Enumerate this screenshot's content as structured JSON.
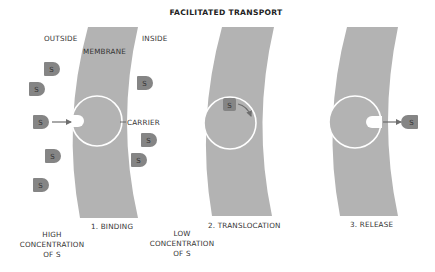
{
  "title": "FACILITATED TRANSPORT",
  "labels": {
    "outside": "OUTSIDE",
    "inside": "INSIDE",
    "membrane": "MEMBRANE",
    "carrier": "CARRIER"
  },
  "steps": [
    {
      "label": "1. BINDING"
    },
    {
      "label": "2. TRANSLOCATION"
    },
    {
      "label": "3. RELEASE"
    }
  ],
  "concentration": {
    "high": [
      "HIGH",
      "CONCENTRATION",
      "OF S"
    ],
    "low": [
      "LOW",
      "CONCENTRATION",
      "OF S"
    ]
  },
  "molecule_symbol": "S",
  "colors": {
    "membrane": "#b3b3b3",
    "molecule": "#858585",
    "carrier_outline": "#ffffff",
    "arrow": "#6e6e6e",
    "text": "#333333"
  }
}
